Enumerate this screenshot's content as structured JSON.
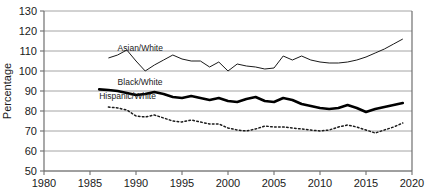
{
  "chart_data": {
    "type": "line",
    "title": "",
    "xlabel": "",
    "ylabel": "Percentage",
    "xlim": [
      1980,
      2020
    ],
    "ylim": [
      50,
      130
    ],
    "xticks": [
      1980,
      1985,
      1990,
      1995,
      2000,
      2005,
      2010,
      2015,
      2020
    ],
    "yticks": [
      50,
      60,
      70,
      80,
      90,
      100,
      110,
      120,
      130
    ],
    "grid": true,
    "legend_position": "inline-labels",
    "series": [
      {
        "name": "Asian/White",
        "style": "thin-solid",
        "color": "#1a1a1a",
        "label_x": 1988,
        "label_y": 110,
        "x": [
          1987,
          1988,
          1989,
          1990,
          1991,
          1992,
          1993,
          1994,
          1995,
          1996,
          1997,
          1998,
          1999,
          2000,
          2001,
          2002,
          2003,
          2004,
          2005,
          2006,
          2007,
          2008,
          2009,
          2010,
          2011,
          2012,
          2013,
          2014,
          2015,
          2016,
          2017,
          2018,
          2019
        ],
        "values": [
          106.5,
          108.0,
          110.5,
          105.0,
          100.0,
          103.0,
          105.5,
          108.0,
          106.0,
          105.0,
          105.0,
          102.0,
          104.5,
          100.0,
          103.5,
          102.5,
          102.0,
          101.0,
          101.5,
          107.5,
          105.5,
          107.5,
          105.5,
          104.5,
          104.0,
          104.0,
          104.5,
          105.5,
          107.0,
          109.0,
          111.0,
          113.5,
          116.0
        ]
      },
      {
        "name": "Black/White",
        "style": "thick-solid",
        "color": "#000000",
        "label_x": 1988,
        "label_y": 93,
        "x": [
          1986,
          1987,
          1988,
          1989,
          1990,
          1991,
          1992,
          1993,
          1994,
          1995,
          1996,
          1997,
          1998,
          1999,
          2000,
          2001,
          2002,
          2003,
          2004,
          2005,
          2006,
          2007,
          2008,
          2009,
          2010,
          2011,
          2012,
          2013,
          2014,
          2015,
          2016,
          2017,
          2018,
          2019
        ],
        "values": [
          90.8,
          90.5,
          90.0,
          89.0,
          88.0,
          88.5,
          89.5,
          88.5,
          87.0,
          86.5,
          87.5,
          86.5,
          85.5,
          86.5,
          85.0,
          84.5,
          86.0,
          87.0,
          85.0,
          84.5,
          86.5,
          85.5,
          83.5,
          82.5,
          81.5,
          81.0,
          81.5,
          83.0,
          81.5,
          79.5,
          81.0,
          82.0,
          83.0,
          84.0
        ]
      },
      {
        "name": "Hispanic/White",
        "style": "dotted",
        "color": "#1a1a1a",
        "label_x": 1986,
        "label_y": 86,
        "x": [
          1987,
          1988,
          1989,
          1990,
          1991,
          1992,
          1993,
          1994,
          1995,
          1996,
          1997,
          1998,
          1999,
          2000,
          2001,
          2002,
          2003,
          2004,
          2005,
          2006,
          2007,
          2008,
          2009,
          2010,
          2011,
          2012,
          2013,
          2014,
          2015,
          2016,
          2017,
          2018,
          2019
        ],
        "values": [
          82.0,
          81.5,
          80.5,
          77.5,
          77.0,
          78.0,
          76.5,
          75.0,
          74.5,
          75.5,
          74.5,
          73.5,
          73.5,
          71.5,
          70.5,
          70.0,
          71.0,
          72.5,
          72.0,
          72.0,
          71.5,
          71.0,
          70.5,
          70.0,
          70.5,
          72.0,
          73.0,
          72.0,
          70.5,
          69.0,
          70.5,
          72.0,
          74.0
        ]
      }
    ]
  }
}
